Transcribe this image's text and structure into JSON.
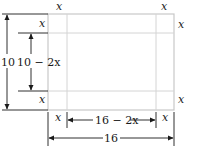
{
  "diagram": {
    "colors": {
      "sheet_outline": "#c8c8c8",
      "cut_lines": "#d4d4d4",
      "dimension_lines": "#1a1a1a",
      "text": "#1a1a1a"
    },
    "labels": {
      "corner_top_left_top": "x",
      "corner_top_left_side": "x",
      "corner_top_right_top": "x",
      "corner_top_right_side": "x",
      "corner_bottom_left_side": "x",
      "corner_bottom_left_bottom": "x",
      "corner_bottom_right_side": "x",
      "corner_bottom_right_bottom": "x",
      "outer_height": "10",
      "inner_height": "10 − 2x",
      "inner_width": "16 − 2x",
      "outer_width": "16"
    }
  }
}
